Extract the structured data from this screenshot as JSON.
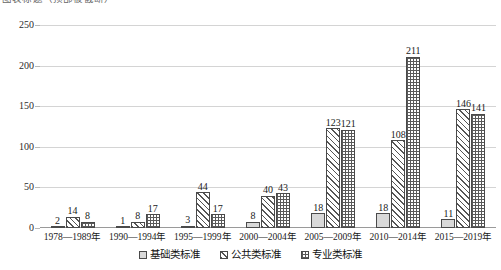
{
  "chart_data": {
    "type": "bar",
    "title": "图表标题（顶部被截断）",
    "xlabel": "",
    "ylabel": "",
    "ylim": [
      0,
      250
    ],
    "yticks": [
      0,
      50,
      100,
      150,
      200,
      250
    ],
    "grid": true,
    "legend_position": "bottom",
    "categories": [
      "1978—1989年",
      "1990—1994年",
      "1995—1999年",
      "2000—2004年",
      "2005—2009年",
      "2010—2014年",
      "2015—2019年"
    ],
    "series": [
      {
        "name": "基础类标准",
        "fill": "solid-gray",
        "color": "#d9d9d9",
        "values": [
          2,
          1,
          3,
          8,
          18,
          18,
          11
        ]
      },
      {
        "name": "公共类标准",
        "fill": "diagonal-hatch",
        "color": "#ffffff",
        "values": [
          14,
          8,
          44,
          40,
          123,
          108,
          146
        ]
      },
      {
        "name": "专业类标准",
        "fill": "cross-hatch",
        "color": "#ffffff",
        "values": [
          8,
          17,
          17,
          43,
          121,
          211,
          141
        ]
      }
    ]
  },
  "legend": {
    "items": [
      {
        "label": "基础类标准"
      },
      {
        "label": "公共类标准"
      },
      {
        "label": "专业类标准"
      }
    ]
  }
}
